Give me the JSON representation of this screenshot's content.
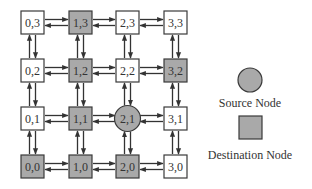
{
  "diagram": {
    "type": "mesh-network",
    "colors": {
      "white_node": "#ffffff",
      "gray_node": "#a9a9a9",
      "stroke": "#3a3a3a"
    },
    "nodes": [
      {
        "id": "0,3",
        "label": "0,3",
        "col": 0,
        "row": 0,
        "kind": "normal"
      },
      {
        "id": "1,3",
        "label": "1,3",
        "col": 1,
        "row": 0,
        "kind": "destination"
      },
      {
        "id": "2,3",
        "label": "2,3",
        "col": 2,
        "row": 0,
        "kind": "normal"
      },
      {
        "id": "3,3",
        "label": "3,3",
        "col": 3,
        "row": 0,
        "kind": "normal"
      },
      {
        "id": "0,2",
        "label": "0,2",
        "col": 0,
        "row": 1,
        "kind": "normal"
      },
      {
        "id": "1,2",
        "label": "1,2",
        "col": 1,
        "row": 1,
        "kind": "destination"
      },
      {
        "id": "2,2",
        "label": "2,2",
        "col": 2,
        "row": 1,
        "kind": "normal"
      },
      {
        "id": "3,2",
        "label": "3,2",
        "col": 3,
        "row": 1,
        "kind": "destination"
      },
      {
        "id": "0,1",
        "label": "0,1",
        "col": 0,
        "row": 2,
        "kind": "normal"
      },
      {
        "id": "1,1",
        "label": "1,1",
        "col": 1,
        "row": 2,
        "kind": "destination"
      },
      {
        "id": "2,1",
        "label": "2,1",
        "col": 2,
        "row": 2,
        "kind": "source"
      },
      {
        "id": "3,1",
        "label": "3,1",
        "col": 3,
        "row": 2,
        "kind": "normal"
      },
      {
        "id": "0,0",
        "label": "0,0",
        "col": 0,
        "row": 3,
        "kind": "destination"
      },
      {
        "id": "1,0",
        "label": "1,0",
        "col": 1,
        "row": 3,
        "kind": "destination"
      },
      {
        "id": "2,0",
        "label": "2,0",
        "col": 2,
        "row": 3,
        "kind": "destination"
      },
      {
        "id": "3,0",
        "label": "3,0",
        "col": 3,
        "row": 3,
        "kind": "normal"
      }
    ],
    "links": "bidirectional arrows between all horizontally and vertically adjacent nodes",
    "legend": {
      "source_label": "Source Node",
      "destination_label": "Destination Node"
    }
  }
}
